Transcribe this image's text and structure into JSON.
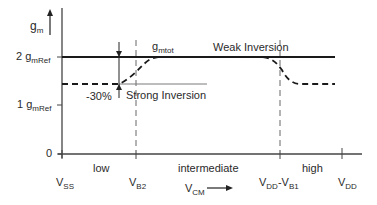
{
  "diagram": {
    "type": "transconductance-vs-common-mode-input",
    "y_axis": {
      "label": "g",
      "label_sub": "m",
      "ticks": [
        {
          "value": "2 g",
          "sub": "mRef",
          "level": "2"
        },
        {
          "value": "1 g",
          "sub": "mRef",
          "level": "1"
        },
        {
          "value": "0",
          "sub": "",
          "level": "0"
        }
      ]
    },
    "x_axis": {
      "label": "V",
      "label_sub": "CM",
      "ticks": [
        {
          "main": "V",
          "sub": "SS"
        },
        {
          "main": "V",
          "sub": "B2"
        },
        {
          "main": "V",
          "sub": "DD",
          "main2": "-V",
          "sub2": "B1"
        },
        {
          "main": "V",
          "sub": "DD"
        }
      ],
      "regions": [
        "low",
        "intermediate",
        "high"
      ]
    },
    "curves": {
      "weak_inversion": {
        "label": "Weak Inversion",
        "style": "solid"
      },
      "total": {
        "label": "g",
        "label_sub": "mtot",
        "style": "dashed"
      },
      "strong_inversion": {
        "label": "Strong Inversion",
        "style": "solid-gray"
      }
    },
    "annotation": {
      "text": "-30%"
    }
  },
  "colors": {
    "line": "#1a1a1a",
    "gray_line": "#7a7a7a",
    "text": "#2a2a2a"
  }
}
